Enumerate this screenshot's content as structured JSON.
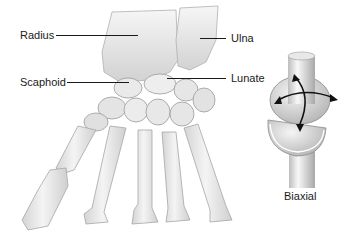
{
  "figure": {
    "labels": {
      "radius": "Radius",
      "ulna": "Ulna",
      "scaphoid": "Scaphoid",
      "lunate": "Lunate"
    },
    "joint_model": {
      "caption": "Biaxial",
      "icon": "biaxial-joint-icon",
      "arrows": "two-axis-rotation-arrows-icon"
    },
    "colors": {
      "bone_fill": "#ececec",
      "bone_shade": "#c8c8c8",
      "bone_outline": "#9a9a9a",
      "text": "#1a1a1a",
      "background": "#ffffff"
    }
  }
}
